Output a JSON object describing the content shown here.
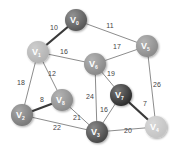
{
  "graph": {
    "title": "Weighted undirected graph",
    "nodes": [
      {
        "id": "V0",
        "letter": "V",
        "sub": "0",
        "x": 76,
        "y": 20,
        "r": 11,
        "color": "#595959"
      },
      {
        "id": "V1",
        "letter": "V",
        "sub": "1",
        "x": 38,
        "y": 52,
        "r": 11,
        "color": "#b3b3b3"
      },
      {
        "id": "V5",
        "letter": "V",
        "sub": "5",
        "x": 147,
        "y": 46,
        "r": 11,
        "color": "#8c8c8c"
      },
      {
        "id": "V6",
        "letter": "V",
        "sub": "6",
        "x": 95,
        "y": 64,
        "r": 11,
        "color": "#8a8a8a"
      },
      {
        "id": "V7",
        "letter": "V",
        "sub": "7",
        "x": 121,
        "y": 95,
        "r": 11,
        "color": "#2e2e2e"
      },
      {
        "id": "V8",
        "letter": "V",
        "sub": "8",
        "x": 62,
        "y": 100,
        "r": 11,
        "color": "#8c8c8c"
      },
      {
        "id": "V2",
        "letter": "V",
        "sub": "2",
        "x": 22,
        "y": 115,
        "r": 11,
        "color": "#7a7a7a"
      },
      {
        "id": "V3",
        "letter": "V",
        "sub": "3",
        "x": 97,
        "y": 132,
        "r": 11,
        "color": "#4a4a4a"
      },
      {
        "id": "V4",
        "letter": "V",
        "sub": "4",
        "x": 156,
        "y": 127,
        "r": 11,
        "color": "#c4c4c4"
      }
    ],
    "edges": [
      {
        "from": "V0",
        "to": "V1",
        "weight": "10",
        "thick": true,
        "lx": 54,
        "ly": 30
      },
      {
        "from": "V0",
        "to": "V5",
        "weight": "11",
        "thick": false,
        "lx": 110,
        "ly": 28
      },
      {
        "from": "V1",
        "to": "V6",
        "weight": "16",
        "thick": false,
        "lx": 64,
        "ly": 54
      },
      {
        "from": "V6",
        "to": "V5",
        "weight": "17",
        "thick": false,
        "lx": 117,
        "ly": 49
      },
      {
        "from": "V1",
        "to": "V2",
        "weight": "18",
        "thick": false,
        "lx": 21,
        "ly": 85
      },
      {
        "from": "V1",
        "to": "V8",
        "weight": "12",
        "thick": false,
        "lx": 52,
        "ly": 76
      },
      {
        "from": "V2",
        "to": "V8",
        "weight": "8",
        "thick": true,
        "lx": 42,
        "ly": 102
      },
      {
        "from": "V2",
        "to": "V3",
        "weight": "22",
        "thick": false,
        "lx": 57,
        "ly": 130
      },
      {
        "from": "V8",
        "to": "V3",
        "weight": "21",
        "thick": false,
        "lx": 77,
        "ly": 120
      },
      {
        "from": "V6",
        "to": "V3",
        "weight": "24",
        "thick": false,
        "lx": 90,
        "ly": 99
      },
      {
        "from": "V6",
        "to": "V7",
        "weight": "19",
        "thick": false,
        "lx": 111,
        "ly": 76
      },
      {
        "from": "V7",
        "to": "V3",
        "weight": "16",
        "thick": false,
        "lx": 104,
        "ly": 112
      },
      {
        "from": "V7",
        "to": "V4",
        "weight": "7",
        "thick": true,
        "lx": 145,
        "ly": 106
      },
      {
        "from": "V3",
        "to": "V4",
        "weight": "20",
        "thick": false,
        "lx": 128,
        "ly": 133
      },
      {
        "from": "V5",
        "to": "V4",
        "weight": "26",
        "thick": false,
        "lx": 157,
        "ly": 87
      }
    ]
  }
}
